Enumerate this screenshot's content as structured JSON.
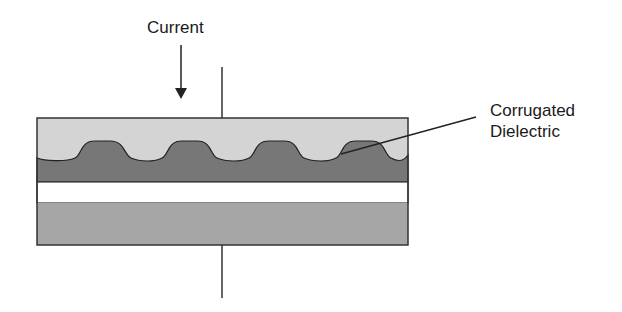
{
  "labels": {
    "current": "Current",
    "corrugated_line1": "Corrugated",
    "corrugated_line2": "Dielectric"
  },
  "colors": {
    "top_plate": "#d4d4d4",
    "dielectric": "#777777",
    "gap": "#ffffff",
    "bottom_plate": "#a6a6a6",
    "stroke": "#333333"
  }
}
